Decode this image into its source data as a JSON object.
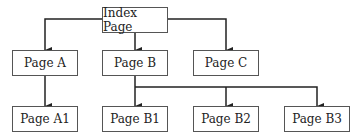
{
  "diagram": {
    "type": "site-hierarchy",
    "nodes": [
      {
        "id": "index",
        "label": "Index Page",
        "x": 102,
        "y": 7,
        "w": 66,
        "h": 26
      },
      {
        "id": "a",
        "label": "Page A",
        "x": 12,
        "y": 50,
        "w": 66,
        "h": 26
      },
      {
        "id": "b",
        "label": "Page B",
        "x": 102,
        "y": 50,
        "w": 66,
        "h": 26
      },
      {
        "id": "c",
        "label": "Page C",
        "x": 193,
        "y": 50,
        "w": 66,
        "h": 26
      },
      {
        "id": "a1",
        "label": "Page A1",
        "x": 12,
        "y": 106,
        "w": 66,
        "h": 26
      },
      {
        "id": "b1",
        "label": "Page B1",
        "x": 102,
        "y": 106,
        "w": 66,
        "h": 26
      },
      {
        "id": "b2",
        "label": "Page B2",
        "x": 193,
        "y": 106,
        "w": 66,
        "h": 26
      },
      {
        "id": "b3",
        "label": "Page B3",
        "x": 284,
        "y": 106,
        "w": 66,
        "h": 26
      }
    ],
    "edges": [
      {
        "from": "index",
        "to": "a"
      },
      {
        "from": "index",
        "to": "b"
      },
      {
        "from": "index",
        "to": "c"
      },
      {
        "from": "a",
        "to": "a1"
      },
      {
        "from": "b",
        "to": "b1"
      },
      {
        "from": "b",
        "to": "b2"
      },
      {
        "from": "b",
        "to": "b3"
      }
    ],
    "colors": {
      "line": "#222222",
      "border": "#555555",
      "text": "#222222"
    }
  }
}
